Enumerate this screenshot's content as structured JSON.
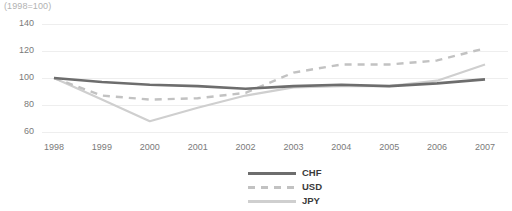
{
  "chart_data": {
    "type": "line",
    "title": "(1998=100)",
    "xlabel": "",
    "ylabel": "",
    "grid": true,
    "legend_position": "bottom-center",
    "ylim": [
      60,
      140
    ],
    "yticks": [
      60,
      80,
      100,
      120,
      140
    ],
    "categories": [
      "1998",
      "1999",
      "2000",
      "2001",
      "2002",
      "2003",
      "2004",
      "2005",
      "2006",
      "2007"
    ],
    "x": [
      1998,
      1999,
      2000,
      2001,
      2002,
      2003,
      2004,
      2005,
      2006,
      2007
    ],
    "series": [
      {
        "name": "CHF",
        "color": "#6d6d6d",
        "style": "solid",
        "width": 2.6,
        "values": [
          100,
          97,
          95,
          94,
          92,
          94,
          95,
          94,
          96,
          99
        ]
      },
      {
        "name": "USD",
        "color": "#c2c2c2",
        "style": "dashed",
        "width": 2.4,
        "values": [
          100,
          87,
          84,
          85,
          89,
          104,
          110,
          110,
          113,
          122
        ]
      },
      {
        "name": "JPY",
        "color": "#cfcfcf",
        "style": "solid",
        "width": 2.2,
        "values": [
          100,
          84,
          68,
          78,
          87,
          93,
          94,
          94,
          98,
          110
        ]
      }
    ]
  },
  "axes": {
    "ytick_labels": [
      "140",
      "120",
      "100",
      "80",
      "60"
    ],
    "xtick_labels": [
      "1998",
      "1999",
      "2000",
      "2001",
      "2002",
      "2003",
      "2004",
      "2005",
      "2006",
      "2007"
    ]
  },
  "legend": {
    "items": [
      {
        "label": "CHF",
        "color": "#6d6d6d",
        "style": "solid"
      },
      {
        "label": "USD",
        "color": "#c2c2c2",
        "style": "dashed"
      },
      {
        "label": "JPY",
        "color": "#cfcfcf",
        "style": "solid"
      }
    ]
  },
  "colors": {
    "background": "#ffffff",
    "gridline": "#eeeeee",
    "tick_text": "#7a7a7a",
    "title_text": "#b2b2b2",
    "chf": "#6d6d6d",
    "usd": "#c2c2c2",
    "jpy": "#cfcfcf"
  }
}
